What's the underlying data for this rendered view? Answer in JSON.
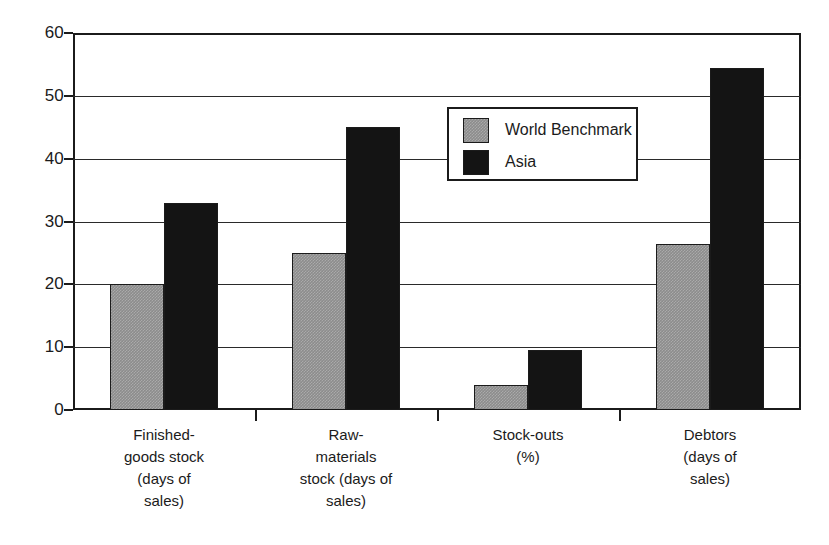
{
  "chart_data": {
    "type": "bar",
    "title": "",
    "subtitle": "",
    "xlabel": "",
    "ylabel": "",
    "ylim": [
      0,
      60
    ],
    "y_ticks": [
      0,
      10,
      20,
      30,
      40,
      50,
      60
    ],
    "y_tick_labels": [
      "0",
      "10",
      "20",
      "30",
      "40",
      "50",
      "60"
    ],
    "grid": true,
    "legend_position": "center",
    "categories": [
      "Finished-goods stock (days of sales)",
      "Raw-materials stock (days of sales)",
      "Stock-outs (%)",
      "Debtors (days of sales)"
    ],
    "category_label_lines": [
      [
        "Finished-",
        "goods stock",
        "(days of",
        "sales)"
      ],
      [
        "Raw-",
        "materials",
        "stock (days of",
        "sales)"
      ],
      [
        "Stock-outs",
        "(%)"
      ],
      [
        "Debtors",
        "(days of",
        "sales)"
      ]
    ],
    "series": [
      {
        "name": "World Benchmark",
        "color": "#8c8c8c",
        "values": [
          20,
          25,
          4,
          26.5
        ]
      },
      {
        "name": "Asia",
        "color": "#141414",
        "values": [
          33,
          45,
          9.5,
          54.5
        ]
      }
    ]
  },
  "legend": {
    "entries": [
      {
        "label": "World Benchmark"
      },
      {
        "label": "Asia"
      }
    ]
  },
  "colors": {
    "series_world_benchmark": "#8c8c8c",
    "series_asia": "#141414",
    "axis": "#1b1b1b",
    "grid": "#2a2a2a",
    "background": "#ffffff"
  }
}
